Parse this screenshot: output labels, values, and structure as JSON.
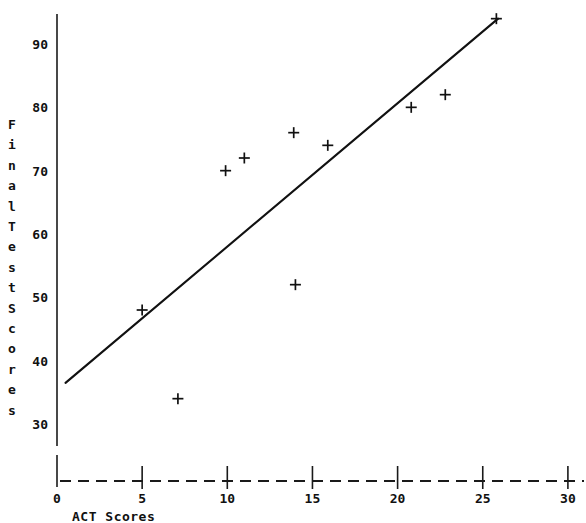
{
  "chart_data": {
    "type": "scatter",
    "title": "",
    "xlabel": "ACT Scores",
    "ylabel": "Final Test Scores",
    "ylabel_chars": [
      "F",
      "i",
      "n",
      "a",
      "l",
      "T",
      "e",
      "s",
      "t",
      "S",
      "c",
      "o",
      "r",
      "e",
      "s"
    ],
    "xlim": [
      0,
      30
    ],
    "ylim": [
      27,
      96
    ],
    "xticks": [
      0,
      5,
      10,
      15,
      20,
      25,
      30
    ],
    "xtick_labels": [
      "0",
      "5",
      "10",
      "15",
      "20",
      "25",
      "30"
    ],
    "yticks": [
      30,
      40,
      50,
      60,
      70,
      80,
      90
    ],
    "ytick_labels": [
      "30",
      "40",
      "50",
      "60",
      "70",
      "80",
      "90"
    ],
    "grid": false,
    "legend": "none",
    "marker": "plus",
    "marker_color": "#111111",
    "line_color": "#111111",
    "x": [
      5.0,
      7.1,
      9.9,
      11.0,
      13.9,
      14.0,
      15.9,
      20.8,
      22.8,
      25.8
    ],
    "y": [
      48,
      34,
      70,
      72,
      76,
      52,
      74,
      80,
      82,
      94
    ],
    "points": [
      {
        "x": 5.0,
        "y": 48
      },
      {
        "x": 7.1,
        "y": 34
      },
      {
        "x": 9.9,
        "y": 70
      },
      {
        "x": 11.0,
        "y": 72
      },
      {
        "x": 13.9,
        "y": 76
      },
      {
        "x": 14.0,
        "y": 52
      },
      {
        "x": 15.9,
        "y": 74
      },
      {
        "x": 20.8,
        "y": 80
      },
      {
        "x": 22.8,
        "y": 82
      },
      {
        "x": 25.8,
        "y": 94
      }
    ],
    "trendline": {
      "name": "least-squares fit",
      "x0": 0.5,
      "y0": 36.5,
      "x1": 25.9,
      "y1": 94.0
    }
  }
}
